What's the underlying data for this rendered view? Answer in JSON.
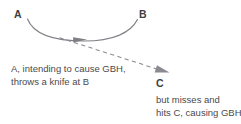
{
  "diagram": {
    "title_absent": true,
    "background_color": "#ffffff",
    "stroke_color": "#7e7e85",
    "text_color": "#4a4a4d",
    "label_color": "#3f3f42",
    "nodes": [
      {
        "id": "A",
        "label": "A",
        "x": 14,
        "y": 9
      },
      {
        "id": "B",
        "label": "B",
        "x": 139,
        "y": 9
      },
      {
        "id": "C",
        "label": "C",
        "x": 156,
        "y": 78
      }
    ],
    "connectors": [
      {
        "name": "intended-throw-arc",
        "style": "solid",
        "from": "A",
        "to": "B",
        "arrowhead": "mid-right",
        "description": "curved solid arc from A sweeping downward and up to B"
      },
      {
        "name": "actual-path-dashed",
        "style": "dashed",
        "from": "A",
        "to": "C",
        "arrowhead": "end",
        "description": "dashed straight arrow continuing down-right to C"
      }
    ],
    "captions": {
      "left": {
        "name": "intent-caption",
        "lines": [
          "A, intending to cause GBH,",
          "throws a knife at B"
        ]
      },
      "right": {
        "name": "outcome-caption",
        "lines": [
          "but misses and",
          "hits C, causing GBH"
        ]
      }
    }
  }
}
